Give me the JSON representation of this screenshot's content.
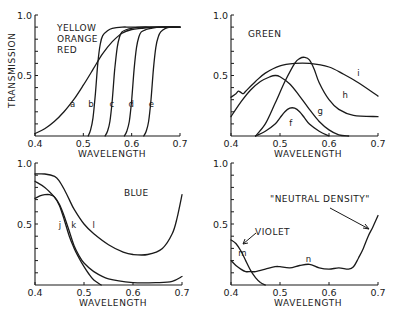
{
  "chart_data": [
    {
      "id": "panel-yellow-orange-red",
      "type": "line",
      "title_lines": [
        "YELLOW",
        "ORANGE",
        "RED"
      ],
      "xlabel": "WAVELENGTH",
      "ylabel": "TRANSMISSION",
      "xlim": [
        0.4,
        0.7
      ],
      "ylim": [
        0,
        1.0
      ],
      "xticks": [
        "0.4",
        "0.5",
        "0.6",
        "0.7"
      ],
      "yticks_labeled": [
        "0.5",
        "1.0"
      ],
      "grid": false,
      "series": [
        {
          "name": "a",
          "x": [
            0.4,
            0.42,
            0.44,
            0.46,
            0.48,
            0.5,
            0.52,
            0.54,
            0.56,
            0.58,
            0.6,
            0.62,
            0.65,
            0.7
          ],
          "y": [
            0.02,
            0.06,
            0.12,
            0.2,
            0.3,
            0.42,
            0.55,
            0.68,
            0.78,
            0.85,
            0.88,
            0.89,
            0.9,
            0.9
          ],
          "label_at": [
            0.478,
            0.24
          ]
        },
        {
          "name": "b",
          "x": [
            0.51,
            0.515,
            0.52,
            0.525,
            0.53,
            0.535,
            0.54,
            0.55,
            0.56,
            0.58,
            0.6,
            0.65,
            0.7
          ],
          "y": [
            0.0,
            0.05,
            0.15,
            0.35,
            0.6,
            0.76,
            0.83,
            0.87,
            0.89,
            0.9,
            0.9,
            0.9,
            0.9
          ],
          "label_at": [
            0.516,
            0.24
          ]
        },
        {
          "name": "c",
          "x": [
            0.545,
            0.55,
            0.555,
            0.56,
            0.565,
            0.57,
            0.575,
            0.58,
            0.59,
            0.6,
            0.62,
            0.65,
            0.7
          ],
          "y": [
            0.0,
            0.04,
            0.12,
            0.3,
            0.55,
            0.73,
            0.82,
            0.86,
            0.88,
            0.89,
            0.9,
            0.9,
            0.9
          ],
          "label_at": [
            0.559,
            0.24
          ]
        },
        {
          "name": "d",
          "x": [
            0.585,
            0.59,
            0.595,
            0.6,
            0.605,
            0.61,
            0.615,
            0.62,
            0.63,
            0.64,
            0.66,
            0.7
          ],
          "y": [
            0.0,
            0.04,
            0.12,
            0.3,
            0.55,
            0.73,
            0.82,
            0.86,
            0.88,
            0.89,
            0.9,
            0.9
          ],
          "label_at": [
            0.599,
            0.24
          ]
        },
        {
          "name": "e",
          "x": [
            0.625,
            0.63,
            0.635,
            0.64,
            0.645,
            0.65,
            0.655,
            0.66,
            0.67,
            0.68,
            0.7
          ],
          "y": [
            0.0,
            0.04,
            0.12,
            0.3,
            0.55,
            0.73,
            0.82,
            0.86,
            0.89,
            0.9,
            0.9
          ],
          "label_at": [
            0.641,
            0.24
          ]
        }
      ]
    },
    {
      "id": "panel-green",
      "type": "line",
      "title_lines": [
        "GREEN"
      ],
      "xlabel": "WAVELENGTH",
      "ylabel": "",
      "xlim": [
        0.4,
        0.7
      ],
      "ylim": [
        0,
        1.0
      ],
      "xticks": [
        "0.4",
        "0.5",
        "0.6",
        "0.7"
      ],
      "yticks_labeled": [
        "0.5",
        "1.0"
      ],
      "grid": false,
      "series": [
        {
          "name": "f",
          "x": [
            0.45,
            0.47,
            0.49,
            0.5,
            0.51,
            0.52,
            0.53,
            0.54,
            0.55,
            0.56,
            0.58,
            0.6
          ],
          "y": [
            0.0,
            0.04,
            0.1,
            0.15,
            0.2,
            0.23,
            0.23,
            0.2,
            0.15,
            0.1,
            0.04,
            0.0
          ],
          "label_at": [
            0.522,
            0.08
          ]
        },
        {
          "name": "g",
          "x": [
            0.4,
            0.42,
            0.44,
            0.46,
            0.48,
            0.49,
            0.5,
            0.52,
            0.54,
            0.56,
            0.58,
            0.6,
            0.62,
            0.64
          ],
          "y": [
            0.16,
            0.28,
            0.38,
            0.45,
            0.49,
            0.5,
            0.49,
            0.43,
            0.33,
            0.22,
            0.12,
            0.05,
            0.01,
            0.0
          ],
          "label_at": [
            0.582,
            0.18
          ]
        },
        {
          "name": "h",
          "x": [
            0.45,
            0.47,
            0.49,
            0.51,
            0.53,
            0.54,
            0.55,
            0.56,
            0.57,
            0.58,
            0.6,
            0.62,
            0.65,
            0.7
          ],
          "y": [
            0.0,
            0.1,
            0.27,
            0.45,
            0.6,
            0.64,
            0.65,
            0.63,
            0.55,
            0.44,
            0.3,
            0.22,
            0.17,
            0.16
          ],
          "label_at": [
            0.633,
            0.31
          ]
        },
        {
          "name": "i",
          "x": [
            0.4,
            0.41,
            0.415,
            0.42,
            0.425,
            0.43,
            0.45,
            0.47,
            0.5,
            0.53,
            0.56,
            0.6,
            0.63,
            0.66,
            0.7
          ],
          "y": [
            0.32,
            0.35,
            0.37,
            0.36,
            0.35,
            0.37,
            0.45,
            0.52,
            0.58,
            0.6,
            0.6,
            0.57,
            0.51,
            0.44,
            0.33
          ],
          "label_at": [
            0.66,
            0.5
          ]
        }
      ]
    },
    {
      "id": "panel-blue",
      "type": "line",
      "title_lines": [
        "BLUE"
      ],
      "xlabel": "WAVELENGTH",
      "ylabel": "",
      "xlim": [
        0.4,
        0.7
      ],
      "ylim": [
        0,
        1.0
      ],
      "xticks": [
        "0.4",
        "0.5",
        "0.6",
        "0.7"
      ],
      "yticks_labeled": [
        "0.5",
        "1.0"
      ],
      "grid": false,
      "series": [
        {
          "name": "j",
          "x": [
            0.4,
            0.41,
            0.42,
            0.43,
            0.44,
            0.45,
            0.46,
            0.47,
            0.48,
            0.49,
            0.5,
            0.51,
            0.52,
            0.535
          ],
          "y": [
            0.71,
            0.73,
            0.74,
            0.74,
            0.72,
            0.65,
            0.53,
            0.4,
            0.3,
            0.22,
            0.15,
            0.09,
            0.04,
            0.0
          ],
          "label_at": [
            0.451,
            0.47
          ]
        },
        {
          "name": "k",
          "x": [
            0.4,
            0.42,
            0.44,
            0.45,
            0.46,
            0.47,
            0.48,
            0.49,
            0.5,
            0.52,
            0.55,
            0.6,
            0.65,
            0.68,
            0.7
          ],
          "y": [
            0.85,
            0.8,
            0.72,
            0.66,
            0.56,
            0.44,
            0.32,
            0.24,
            0.18,
            0.11,
            0.05,
            0.02,
            0.02,
            0.03,
            0.07
          ],
          "label_at": [
            0.479,
            0.47
          ]
        },
        {
          "name": "l",
          "x": [
            0.4,
            0.42,
            0.44,
            0.45,
            0.46,
            0.47,
            0.48,
            0.5,
            0.52,
            0.55,
            0.58,
            0.6,
            0.63,
            0.66,
            0.68,
            0.69,
            0.7
          ],
          "y": [
            0.91,
            0.91,
            0.89,
            0.85,
            0.78,
            0.7,
            0.62,
            0.5,
            0.42,
            0.33,
            0.27,
            0.25,
            0.25,
            0.3,
            0.42,
            0.55,
            0.74
          ],
          "label_at": [
            0.52,
            0.47
          ]
        }
      ]
    },
    {
      "id": "panel-violet-neutral",
      "type": "line",
      "title_lines": [],
      "xlabel": "WAVELENGTH",
      "ylabel": "",
      "xlim": [
        0.4,
        0.7
      ],
      "ylim": [
        0,
        1.0
      ],
      "xticks": [
        "0.4",
        "0.5",
        "0.6",
        "0.7"
      ],
      "yticks_labeled": [
        "0.5",
        "1.0"
      ],
      "grid": false,
      "annotations": [
        {
          "text": "VIOLET",
          "points_to": "m"
        },
        {
          "text": "\"NEUTRAL DENSITY\"",
          "points_to": "n"
        }
      ],
      "series": [
        {
          "name": "m",
          "x": [
            0.4,
            0.41,
            0.42,
            0.43,
            0.44,
            0.45,
            0.46,
            0.47
          ],
          "y": [
            0.37,
            0.34,
            0.28,
            0.2,
            0.12,
            0.06,
            0.02,
            0.0
          ],
          "label_at": [
            0.423,
            0.24
          ]
        },
        {
          "name": "n",
          "x": [
            0.4,
            0.41,
            0.42,
            0.43,
            0.44,
            0.45,
            0.47,
            0.49,
            0.5,
            0.52,
            0.54,
            0.56,
            0.58,
            0.6,
            0.62,
            0.64,
            0.65,
            0.66,
            0.67,
            0.68,
            0.69,
            0.7
          ],
          "y": [
            0.2,
            0.16,
            0.13,
            0.11,
            0.11,
            0.11,
            0.13,
            0.15,
            0.15,
            0.14,
            0.16,
            0.17,
            0.14,
            0.13,
            0.14,
            0.13,
            0.15,
            0.22,
            0.3,
            0.4,
            0.48,
            0.57
          ],
          "label_at": [
            0.558,
            0.19
          ]
        }
      ]
    }
  ]
}
